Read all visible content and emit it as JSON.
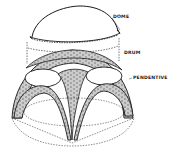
{
  "diagram": {
    "labels": {
      "dome": "DOME",
      "drum": "DRUM",
      "pendentive": "PENDENTIVE"
    },
    "colors": {
      "line": "#1a1a1a",
      "background": "#ffffff"
    }
  }
}
